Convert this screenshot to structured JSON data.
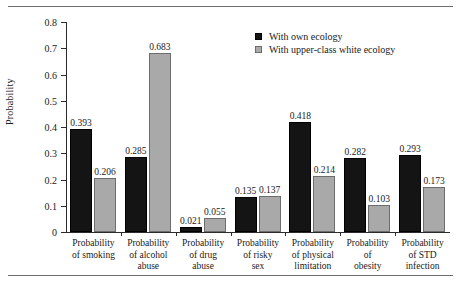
{
  "chart_data": {
    "type": "bar",
    "title": "",
    "xlabel": "",
    "ylabel": "Probability",
    "ylim": [
      0,
      0.8
    ],
    "yticks": [
      "0",
      "0.1",
      "0.2",
      "0.3",
      "0.4",
      "0.5",
      "0.6",
      "0.7",
      "0.8"
    ],
    "ytick_values": [
      0,
      0.1,
      0.2,
      0.3,
      0.4,
      0.5,
      0.6,
      0.7,
      0.8
    ],
    "grid": false,
    "legend_position": "top-right",
    "categories": [
      "Probability of smoking",
      "Probability of alcohol abuse",
      "Probability of drug abuse",
      "Probability of risky sex",
      "Probability of physical limitation",
      "Probability of obesity",
      "Probability of STD infection"
    ],
    "category_lines": [
      [
        "Probability",
        "of smoking"
      ],
      [
        "Probability",
        "of alcohol",
        "abuse"
      ],
      [
        "Probability",
        "of drug",
        "abuse"
      ],
      [
        "Probability",
        "of risky",
        "sex"
      ],
      [
        "Probability",
        "of physical",
        "limitation"
      ],
      [
        "Probability",
        "of",
        "obesity"
      ],
      [
        "Probability",
        "of STD",
        "infection"
      ]
    ],
    "series": [
      {
        "name": "With own ecology",
        "color": "#141414",
        "values": [
          0.393,
          0.285,
          0.021,
          0.135,
          0.418,
          0.282,
          0.293
        ],
        "labels": [
          "0.393",
          "0.285",
          "0.021",
          "0.135",
          "0.418",
          "0.282",
          "0.293"
        ]
      },
      {
        "name": "With upper-class white ecology",
        "color": "#a9a9a9",
        "values": [
          0.206,
          0.683,
          0.055,
          0.137,
          0.214,
          0.103,
          0.173
        ],
        "labels": [
          "0.206",
          "0.683",
          "0.055",
          "0.137",
          "0.214",
          "0.103",
          "0.173"
        ]
      }
    ]
  }
}
